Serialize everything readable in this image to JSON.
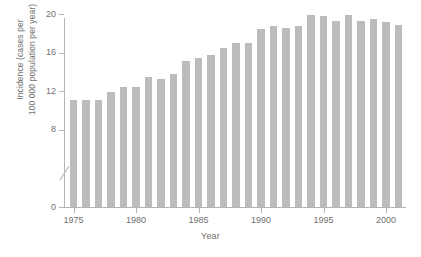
{
  "chart_data": {
    "type": "bar",
    "title": "",
    "subtitle": "",
    "xlabel": "Year",
    "ylabel": "Incidence (cases per\n100 000 population per year)",
    "categories": [
      1975,
      1976,
      1977,
      1978,
      1979,
      1980,
      1981,
      1982,
      1983,
      1984,
      1985,
      1986,
      1987,
      1988,
      1989,
      1990,
      1991,
      1992,
      1993,
      1994,
      1995,
      1996,
      1997,
      1998,
      1999,
      2000,
      2001
    ],
    "values": [
      11.1,
      11.1,
      11.1,
      11.9,
      12.4,
      12.4,
      13.5,
      13.3,
      13.8,
      15.1,
      15.4,
      15.8,
      16.5,
      17.0,
      17.0,
      18.4,
      18.8,
      18.6,
      18.8,
      19.9,
      19.8,
      19.3,
      19.9,
      19.3,
      19.5,
      19.2,
      18.9
    ],
    "series": [
      {
        "name": "Incidence",
        "values": [
          11.1,
          11.1,
          11.1,
          11.9,
          12.4,
          12.4,
          13.5,
          13.3,
          13.8,
          15.1,
          15.4,
          15.8,
          16.5,
          17.0,
          17.0,
          18.4,
          18.8,
          18.6,
          18.8,
          19.9,
          19.8,
          19.3,
          19.9,
          19.3,
          19.5,
          19.2,
          18.9
        ]
      }
    ],
    "ylim": [
      0,
      20
    ],
    "y_ticks": [
      0,
      8,
      12,
      16,
      20
    ],
    "y_tick_labels": [
      "0",
      "8",
      "12",
      "16",
      "20"
    ],
    "y_axis_break": true,
    "y_axis_break_between": [
      0,
      8
    ],
    "x_ticks": [
      1975,
      1980,
      1985,
      1990,
      1995,
      2000
    ],
    "x_tick_labels": [
      "1975",
      "1980",
      "1985",
      "1990",
      "1995",
      "2000"
    ],
    "xlim": [
      1974.4,
      2001.6
    ],
    "grid": false,
    "legend": false,
    "legend_position": "none",
    "bar_color": "#bcbcbc",
    "axis_color": "#b4b4b4",
    "text_color": "#6f6f6f",
    "background_color": "#ffffff",
    "annotations": []
  }
}
